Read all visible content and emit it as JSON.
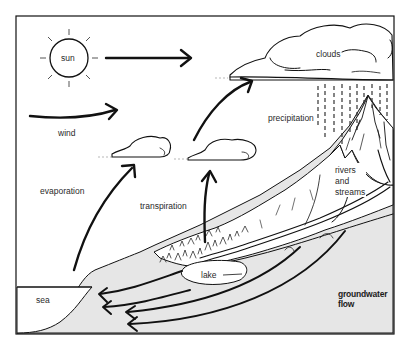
{
  "diagram": {
    "labels": {
      "sun": "sun",
      "clouds": "clouds",
      "wind": "wind",
      "precipitation": "precipitation",
      "rivers_line1": "rivers",
      "rivers_line2": "and",
      "rivers_line3": "streams",
      "evaporation": "evaporation",
      "transpiration": "transpiration",
      "lake": "lake",
      "sea": "sea",
      "groundwater_line1": "groundwater",
      "groundwater_line2": "flow"
    },
    "icons": {
      "sun": "sun-icon",
      "cloud": "cloud-icon",
      "arrow": "arrow-icon",
      "rain": "rain-icon",
      "mountain": "mountain-icon",
      "trees": "trees-icon"
    },
    "colors": {
      "ink": "#111111",
      "ground": "#e6e6e6",
      "background": "#ffffff"
    }
  }
}
